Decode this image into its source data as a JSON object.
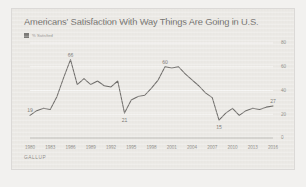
{
  "chart_data": {
    "type": "line",
    "title": "Americans' Satisfaction With Way Things Are Going in U.S.",
    "xlabel": "",
    "ylabel": "",
    "ylim": [
      0,
      80
    ],
    "yticks": [
      "0",
      "20",
      "40",
      "60",
      "80"
    ],
    "grid": true,
    "legend_position": "top-left",
    "legend": [
      "% Satisfied"
    ],
    "source": "GALLUP",
    "axis_side": "right",
    "xticks": [
      "1980",
      "1983",
      "1986",
      "1989",
      "1992",
      "1995",
      "1998",
      "2001",
      "2004",
      "2007",
      "2010",
      "2013",
      "2016"
    ],
    "series": [
      {
        "name": "% Satisfied",
        "x": [
          1980,
          1981,
          1982,
          1983,
          1984,
          1985,
          1986,
          1987,
          1988,
          1989,
          1990,
          1991,
          1992,
          1993,
          1994,
          1995,
          1996,
          1997,
          1998,
          1999,
          2000,
          2001,
          2002,
          2003,
          2004,
          2005,
          2006,
          2007,
          2008,
          2009,
          2010,
          2011,
          2012,
          2013,
          2014,
          2015,
          2016
        ],
        "values": [
          19,
          23,
          25,
          24,
          35,
          51,
          66,
          45,
          50,
          45,
          48,
          44,
          43,
          48,
          21,
          32,
          35,
          36,
          42,
          49,
          60,
          59,
          60,
          54,
          49,
          44,
          38,
          34,
          15,
          21,
          25,
          19,
          23,
          25,
          24,
          26,
          27
        ]
      }
    ],
    "annotations": [
      {
        "label": "19",
        "x": 1980,
        "y": 19
      },
      {
        "label": "66",
        "x": 1986,
        "y": 66
      },
      {
        "label": "21",
        "x": 1994,
        "y": 21
      },
      {
        "label": "60",
        "x": 2000,
        "y": 60
      },
      {
        "label": "15",
        "x": 2008,
        "y": 15
      },
      {
        "label": "27",
        "x": 2016,
        "y": 27
      }
    ]
  }
}
